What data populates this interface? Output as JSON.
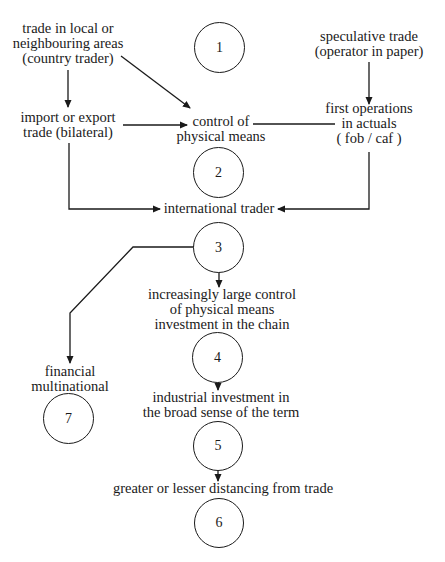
{
  "diagram": {
    "nodes": {
      "local_trade": {
        "lines": [
          "trade in local or",
          "neighbouring areas",
          "(country trader)"
        ]
      },
      "speculative_trade": {
        "lines": [
          "speculative trade",
          "(operator in paper)"
        ]
      },
      "import_export": {
        "lines": [
          "import or export",
          "trade (bilateral)"
        ]
      },
      "control_physical": {
        "lines": [
          "control of",
          "physical means"
        ]
      },
      "first_operations": {
        "lines": [
          "first operations",
          "in actuals",
          "( fob / caf )"
        ]
      },
      "international_trader": {
        "lines": [
          "international trader"
        ]
      },
      "increasing_control": {
        "lines": [
          "increasingly large control",
          "of physical means",
          "investment in the chain"
        ]
      },
      "financial_multinational": {
        "lines": [
          "financial",
          "multinational"
        ]
      },
      "industrial_investment": {
        "lines": [
          "industrial investment in",
          "the broad sense of the term"
        ]
      },
      "distancing": {
        "lines": [
          "greater or lesser distancing from trade"
        ]
      }
    },
    "stages": [
      "1",
      "2",
      "3",
      "4",
      "5",
      "6",
      "7"
    ],
    "edges": [
      {
        "from": "local_trade",
        "to": "import_export"
      },
      {
        "from": "local_trade",
        "to": "control_physical"
      },
      {
        "from": "import_export",
        "to": "control_physical"
      },
      {
        "from": "speculative_trade",
        "to": "first_operations"
      },
      {
        "from": "first_operations",
        "to": "control_physical",
        "arrow": false
      },
      {
        "from": "import_export",
        "to": "international_trader"
      },
      {
        "from": "first_operations",
        "to": "international_trader"
      },
      {
        "from": "stage_3",
        "to": "increasing_control"
      },
      {
        "from": "stage_3",
        "to": "financial_multinational"
      },
      {
        "from": "stage_4",
        "to": "industrial_investment"
      },
      {
        "from": "stage_5",
        "to": "distancing"
      }
    ],
    "line_color": "#1a1a1a"
  }
}
